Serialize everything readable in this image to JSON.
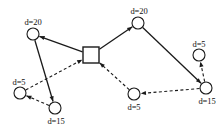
{
  "figure": {
    "width": 224,
    "height": 133,
    "background": "#ffffff",
    "stroke_color": "#1a1a1a"
  },
  "depot": {
    "shape": "square",
    "name": "depot",
    "x": 91,
    "y": 55,
    "size": 16
  },
  "nodes": [
    {
      "id": "n1",
      "label": "d=20",
      "x": 33,
      "y": 34,
      "r": 6,
      "label_x": 33,
      "label_y": 18,
      "name": "customer-node-d20-top-left"
    },
    {
      "id": "n2",
      "label": "d=20",
      "x": 138,
      "y": 23,
      "r": 6,
      "label_x": 139,
      "label_y": 7,
      "name": "customer-node-d20-top-right"
    },
    {
      "id": "n3",
      "label": "d=5",
      "x": 199,
      "y": 55,
      "r": 6,
      "label_x": 199,
      "label_y": 40,
      "name": "customer-node-d5-right"
    },
    {
      "id": "n4",
      "label": "d=15",
      "x": 206,
      "y": 88,
      "r": 6,
      "label_x": 207,
      "label_y": 97,
      "name": "customer-node-d15-right"
    },
    {
      "id": "n5",
      "label": "d=5",
      "x": 134,
      "y": 94,
      "r": 6,
      "label_x": 134,
      "label_y": 103,
      "name": "customer-node-d5-bottom"
    },
    {
      "id": "n6",
      "label": "d=15",
      "x": 55,
      "y": 108,
      "r": 6,
      "label_x": 56,
      "label_y": 117,
      "name": "customer-node-d15-bottom-left"
    },
    {
      "id": "n7",
      "label": "d=5",
      "x": 20,
      "y": 93,
      "r": 6,
      "label_x": 19,
      "label_y": 78,
      "name": "customer-node-d5-left"
    }
  ],
  "edges": [
    {
      "id": "e1",
      "from": "depot",
      "to": "n1",
      "style": "solid",
      "name": "edge-depot-to-d20-top-left"
    },
    {
      "id": "e2",
      "from": "n1",
      "to": "n6",
      "style": "solid",
      "name": "edge-d20-top-left-to-d15-bottom-left"
    },
    {
      "id": "e3",
      "from": "n6",
      "to": "n7",
      "style": "dashed",
      "name": "edge-d15-bottom-left-to-d5-left"
    },
    {
      "id": "e4",
      "from": "n7",
      "to": "depot",
      "style": "dashed",
      "name": "edge-d5-left-to-depot"
    },
    {
      "id": "e5",
      "from": "depot",
      "to": "n2",
      "style": "solid",
      "name": "edge-depot-to-d20-top-right"
    },
    {
      "id": "e6",
      "from": "n2",
      "to": "n4",
      "style": "solid",
      "name": "edge-d20-top-right-to-d15-right"
    },
    {
      "id": "e7",
      "from": "n4",
      "to": "n3",
      "style": "dashed",
      "name": "edge-d15-right-to-d5-right"
    },
    {
      "id": "e8",
      "from": "n4",
      "to": "n5",
      "style": "dashed",
      "name": "edge-d15-right-to-d5-bottom"
    },
    {
      "id": "e9",
      "from": "n5",
      "to": "depot",
      "style": "dashed",
      "name": "edge-d5-bottom-to-depot"
    }
  ]
}
